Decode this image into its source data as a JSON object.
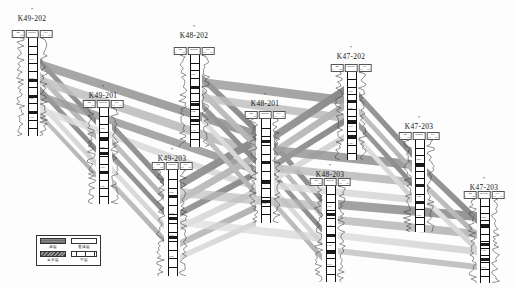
{
  "figure": {
    "type": "well-log-correlation-cross-section",
    "background": "#fdfdfd",
    "width": 516,
    "height": 288
  },
  "palette": {
    "band_dark": "#8f8f8f",
    "band_mid": "#b4b4b4",
    "band_light": "#d6d6d6",
    "spine": "#111111",
    "curve": "#333333",
    "legend_border": "#333333"
  },
  "wells": [
    {
      "name": "K49-202",
      "x": 32,
      "label_y": 14,
      "star_y": 8,
      "header_y": 30,
      "top": 38,
      "height": 98,
      "tracks": [
        {
          "name": "GR",
          "left": "0",
          "right": "150"
        },
        {
          "name": "DEPTH",
          "left": "",
          "right": ""
        },
        {
          "name": "SAL",
          "left": "0.2",
          "right": "20"
        }
      ],
      "marker_blocks": [
        0.42,
        0.58,
        0.74
      ],
      "depths": [
        "1150",
        "1200",
        "1250",
        "1300"
      ]
    },
    {
      "name": "K49-201",
      "x": 103,
      "label_y": 91,
      "star_y": 85,
      "header_y": 100,
      "top": 108,
      "height": 96,
      "tracks": [
        {
          "name": "GR",
          "left": "0",
          "right": "150"
        },
        {
          "name": "DEPTH",
          "left": "",
          "right": ""
        },
        {
          "name": "SAL",
          "left": "0.2",
          "right": "20"
        }
      ],
      "marker_blocks": [
        0.3,
        0.46,
        0.66
      ],
      "depths": [
        "1200",
        "1250",
        "1300",
        "1350"
      ]
    },
    {
      "name": "K49-203",
      "x": 172,
      "label_y": 154,
      "star_y": 148,
      "header_y": 162,
      "top": 170,
      "height": 106,
      "tracks": [
        {
          "name": "GR",
          "left": "0",
          "right": "150"
        },
        {
          "name": "DEPTH",
          "left": "",
          "right": ""
        },
        {
          "name": "SAL",
          "left": "0.2",
          "right": "20"
        }
      ],
      "marker_blocks": [
        0.24,
        0.44,
        0.62
      ],
      "depths": [
        "1250",
        "1300",
        "1350",
        "1400"
      ]
    },
    {
      "name": "K48-202",
      "x": 194,
      "label_y": 31,
      "star_y": 25,
      "header_y": 47,
      "top": 55,
      "height": 92,
      "tracks": [
        {
          "name": "GR",
          "left": "0",
          "right": "150"
        },
        {
          "name": "DEPTH",
          "left": "",
          "right": ""
        },
        {
          "name": "SAL",
          "left": "0.2",
          "right": "20"
        }
      ],
      "marker_blocks": [
        0.34,
        0.52,
        0.7
      ],
      "depths": [
        "1180",
        "1230",
        "1280",
        "1330"
      ]
    },
    {
      "name": "K48-201",
      "x": 265,
      "label_y": 99,
      "star_y": 93,
      "header_y": 111,
      "top": 119,
      "height": 104,
      "tracks": [
        {
          "name": "GR",
          "left": "0",
          "right": "150"
        },
        {
          "name": "DEPTH",
          "left": "",
          "right": ""
        },
        {
          "name": "SAL",
          "left": "0.2",
          "right": "20"
        }
      ],
      "marker_blocks": [
        0.2,
        0.4,
        0.6,
        0.78
      ],
      "depths": [
        "1220",
        "1270",
        "1320",
        "1370"
      ]
    },
    {
      "name": "K48-203",
      "x": 330,
      "label_y": 170,
      "star_y": 164,
      "header_y": 178,
      "top": 186,
      "height": 96,
      "tracks": [
        {
          "name": "GR",
          "left": "0",
          "right": "150"
        },
        {
          "name": "DEPTH",
          "left": "",
          "right": ""
        },
        {
          "name": "SAL",
          "left": "0.2",
          "right": "20"
        }
      ],
      "marker_blocks": [
        0.28,
        0.5,
        0.68
      ],
      "depths": [
        "1260",
        "1310",
        "1360",
        "1410"
      ]
    },
    {
      "name": "K47-202",
      "x": 351,
      "label_y": 52,
      "star_y": 46,
      "header_y": 64,
      "top": 72,
      "height": 88,
      "tracks": [
        {
          "name": "GR",
          "left": "0",
          "right": "150"
        },
        {
          "name": "DEPTH",
          "left": "",
          "right": ""
        },
        {
          "name": "SAL",
          "left": "0.2",
          "right": "20"
        }
      ],
      "marker_blocks": [
        0.32,
        0.54,
        0.72
      ],
      "depths": [
        "1200",
        "1250",
        "1300",
        "1350"
      ]
    },
    {
      "name": "K47-203",
      "x": 419,
      "label_y": 122,
      "star_y": 116,
      "header_y": 132,
      "top": 140,
      "height": 92,
      "tracks": [
        {
          "name": "GR",
          "left": "0",
          "right": "150"
        },
        {
          "name": "DEPTH",
          "left": "",
          "right": ""
        },
        {
          "name": "SAL",
          "left": "0.2",
          "right": "20"
        }
      ],
      "marker_blocks": [
        0.26,
        0.48,
        0.66
      ],
      "depths": [
        "1240",
        "1290",
        "1340",
        "1390"
      ]
    },
    {
      "name": "K47-203",
      "x": 484,
      "label_y": 183,
      "star_y": 177,
      "header_y": 191,
      "top": 199,
      "height": 84,
      "tracks": [
        {
          "name": "GR",
          "left": "0",
          "right": "150"
        },
        {
          "name": "DEPTH",
          "left": "",
          "right": ""
        },
        {
          "name": "SAL",
          "left": "0.2",
          "right": "20"
        }
      ],
      "marker_blocks": [
        0.3,
        0.52,
        0.7
      ],
      "depths": [
        "1280",
        "1330",
        "1380",
        "1430"
      ]
    }
  ],
  "legend": {
    "x": 36,
    "y": 235,
    "width": 59,
    "height": 30,
    "entries": [
      {
        "label": "油层",
        "swatch": "dark-fill"
      },
      {
        "label": "差油层",
        "swatch": "empty-fill"
      },
      {
        "label": "含水层",
        "swatch": "hatch-fill"
      },
      {
        "label": "干层",
        "swatch": "grid-fill"
      }
    ]
  }
}
